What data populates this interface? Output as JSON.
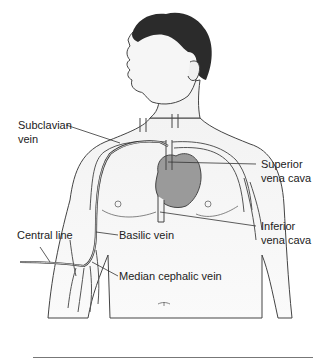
{
  "figure": {
    "labels": {
      "subclavian_1": "Subclavian",
      "subclavian_2": "vein",
      "superior_1": "Superior",
      "superior_2": "vena cava",
      "inferior_1": "Inferior",
      "inferior_2": "vena cava",
      "central_line": "Central line",
      "basilic": "Basilic vein",
      "median_cephalic": "Median cephalic vein"
    },
    "colors": {
      "hair": "#2b2b2b",
      "skin": "#f1f1f1",
      "heart": "#9a9a9a",
      "outline": "#444444",
      "vein": "#555555"
    }
  }
}
